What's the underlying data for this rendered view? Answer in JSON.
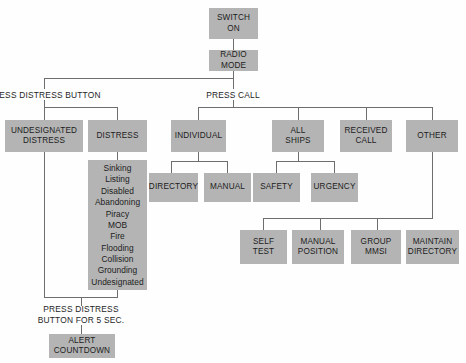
{
  "diagram": {
    "box_fill": "#b4b4b4",
    "line_color": "#6e6e6e",
    "text_color": "#1c1c1c",
    "background": "#fefefe"
  },
  "boxes": {
    "switch_on": "SWITCH\nON",
    "radio_mode": "RADIO\nMODE",
    "undesignated_distress": "UNDESIGNATED\nDISTRESS",
    "distress": "DISTRESS",
    "distress_types": "Sinking\nListing\nDisabled\nAbandoning\nPiracy\nMOB\nFire\nFlooding\nCollision\nGrounding\nUndesignated",
    "individual": "INDIVIDUAL",
    "all_ships": "ALL\nSHIPS",
    "received_call": "RECEIVED\nCALL",
    "other": "OTHER",
    "directory": "DIRECTORY",
    "manual": "MANUAL",
    "safety": "SAFETY",
    "urgency": "URGENCY",
    "self_test": "SELF\nTEST",
    "manual_position": "MANUAL\nPOSITION",
    "group_mmsi": "GROUP\nMMSI",
    "maintain_directory": "MAINTAIN\nDIRECTORY",
    "alert_countdown": "ALERT\nCOUNTDOWN"
  },
  "labels": {
    "press_distress_button": "PRESS DISTRESS BUTTON",
    "press_call": "PRESS CALL",
    "press_distress_button_5sec": "PRESS DISTRESS\nBUTTON FOR 5 SEC."
  },
  "distress_types_list": [
    "Sinking",
    "Listing",
    "Disabled",
    "Abandoning",
    "Piracy",
    "MOB",
    "Fire",
    "Flooding",
    "Collision",
    "Grounding",
    "Undesignated"
  ]
}
